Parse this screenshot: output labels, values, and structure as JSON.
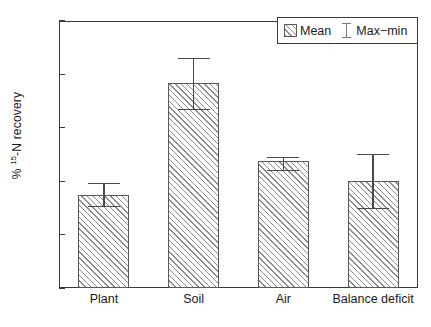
{
  "chart_data": {
    "type": "bar",
    "title": "",
    "xlabel": "",
    "ylabel": "% 15-N recovery",
    "ylabel_prefix": "% ",
    "ylabel_superscript": "15",
    "ylabel_suffix": "-N recovery",
    "ylim": [
      0,
      50
    ],
    "ytick_step": 10,
    "ytick_labels": [
      "0",
      "10",
      "20",
      "30",
      "40",
      "50"
    ],
    "ytick_values": [
      0,
      10,
      20,
      30,
      40,
      50
    ],
    "grid": false,
    "legend_position": "top-right",
    "categories": [
      "Plant",
      "Soil",
      "Air",
      "Balance deficit"
    ],
    "values": [
      17.5,
      38.4,
      23.8,
      20.0
    ],
    "err_max": [
      19.7,
      43.1,
      24.6,
      25.1
    ],
    "err_min": [
      15.2,
      33.3,
      21.9,
      14.7
    ],
    "series": [
      {
        "name": "Mean",
        "values": [
          17.5,
          38.4,
          23.8,
          20.0
        ]
      },
      {
        "name": "Max-min",
        "max": [
          19.7,
          43.1,
          24.6,
          25.1
        ],
        "min": [
          15.2,
          33.3,
          21.9,
          14.7
        ]
      }
    ],
    "bar_color": "#ffffff",
    "hatch_color": "#8a8a8a",
    "bar_edge_color": "#585858",
    "axis_color": "#3a3a3a",
    "error_color": "#4a4a4a"
  },
  "legend": {
    "entries": [
      {
        "label": "Mean",
        "symbol": "hatched-square"
      },
      {
        "label": "Max−min",
        "symbol": "error-bar-ibeam"
      }
    ]
  },
  "axes": {
    "y_ticks": [
      {
        "label": "50",
        "value": 50
      },
      {
        "label": "40",
        "value": 40
      },
      {
        "label": "30",
        "value": 30
      },
      {
        "label": "20",
        "value": 20
      },
      {
        "label": "10",
        "value": 10
      },
      {
        "label": "0",
        "value": 0
      }
    ],
    "x_ticks": [
      {
        "label": "Plant"
      },
      {
        "label": "Soil"
      },
      {
        "label": "Air"
      },
      {
        "label": "Balance deficit"
      }
    ]
  }
}
